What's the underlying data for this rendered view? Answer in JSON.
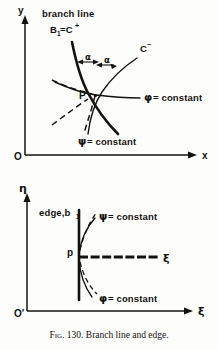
{
  "figure": {
    "caption_prefix": "Fig. 130.",
    "caption_text": "Branch line and edge."
  },
  "upper_panel": {
    "axis_y_label": "y",
    "axis_x_label": "x",
    "origin_label": "O",
    "branch_line_label": "branch line",
    "branch_line_name": "B",
    "branch_line_subscript": "1",
    "branch_line_equals": "=C",
    "branch_line_superscript": "+",
    "c_minus_label": "C",
    "c_minus_superscript": "−",
    "point_label": "P",
    "angle_label_left": "α",
    "angle_label_right": "α",
    "phi_symbol": "φ",
    "phi_constant_text": "= constant",
    "psi_symbol": "ψ",
    "psi_constant_text": "= constant"
  },
  "lower_panel": {
    "axis_eta_label": "η",
    "axis_xi_label": "ξ",
    "inner_xi_label": "ξ",
    "origin_label": "O′",
    "edge_label": "edge,b",
    "edge_subscript": "1",
    "point_label": "p",
    "psi_symbol": "ψ",
    "psi_constant_text": "= constant",
    "phi_symbol": "φ",
    "phi_constant_text": "= constant"
  },
  "colors": {
    "ink": "#14120f",
    "paper": "#fdfdfb"
  }
}
